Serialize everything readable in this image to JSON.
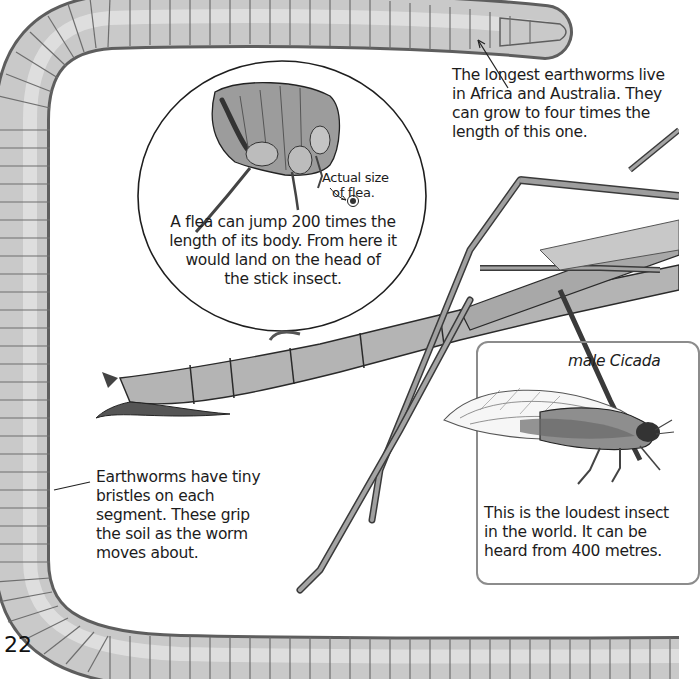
{
  "page": {
    "page_number": "22",
    "background": "#ffffff"
  },
  "captions": {
    "longest_earthworms": {
      "lines": [
        "The longest earthworms live",
        "in Africa and Australia. They",
        "can grow to four times the",
        "length of this one."
      ]
    },
    "flea": {
      "lines": [
        "A flea can jump 200 times the",
        "length of its body. From here it",
        "would land on the head of",
        "the stick insect."
      ]
    },
    "flea_actual_size": {
      "lines": [
        "Actual size",
        "of flea."
      ]
    },
    "cicada_title": "male Cicada",
    "cicada": {
      "lines": [
        "This is the loudest insect",
        "in the world. It can be",
        "heard from 400 metres."
      ]
    },
    "earthworm_bristles": {
      "lines": [
        "Earthworms have tiny",
        "bristles on each",
        "segment. These grip",
        "the soil as the worm",
        "moves about."
      ]
    }
  },
  "illustrations": {
    "earthworm": "earthworm-illustration",
    "flea": "flea-illustration",
    "stick_insect": "stick-insect-illustration",
    "cicada": "cicada-illustration"
  },
  "colors": {
    "worm_body": "#b8b8b8",
    "worm_shadow": "#7a7a7a",
    "insect_body": "#a9a9a9",
    "insect_dark": "#4a4a4a",
    "outline": "#2a2a2a",
    "box_border": "#8c8c8c"
  }
}
